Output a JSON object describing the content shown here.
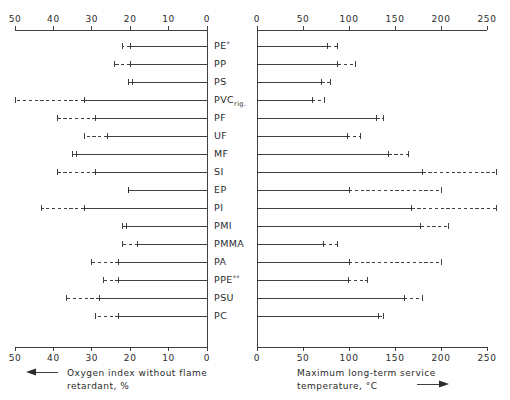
{
  "figure": {
    "background": "#ffffff",
    "ink_color": "#2b2b2b"
  },
  "categories": [
    {
      "label": "PE",
      "sup": "*",
      "sub": ""
    },
    {
      "label": "PP",
      "sup": "",
      "sub": ""
    },
    {
      "label": "PS",
      "sup": "",
      "sub": ""
    },
    {
      "label": "PVC",
      "sup": "",
      "sub": "rig."
    },
    {
      "label": "PF",
      "sup": "",
      "sub": ""
    },
    {
      "label": "UF",
      "sup": "",
      "sub": ""
    },
    {
      "label": "MF",
      "sup": "",
      "sub": ""
    },
    {
      "label": "SI",
      "sup": "",
      "sub": ""
    },
    {
      "label": "EP",
      "sup": "",
      "sub": ""
    },
    {
      "label": "PI",
      "sup": "",
      "sub": ""
    },
    {
      "label": "PMI",
      "sup": "",
      "sub": ""
    },
    {
      "label": "PMMA",
      "sup": "",
      "sub": ""
    },
    {
      "label": "PA",
      "sup": "",
      "sub": ""
    },
    {
      "label": "PPE",
      "sup": "**",
      "sub": ""
    },
    {
      "label": "PSU",
      "sup": "",
      "sub": ""
    },
    {
      "label": "PC",
      "sup": "",
      "sub": ""
    }
  ],
  "chart_data": [
    {
      "type": "bar",
      "orientation": "horizontal-reversed",
      "panel": "left",
      "title": "",
      "xlabel": "Oxygen index without flame retardant, %",
      "ylabel": "",
      "xlim": [
        50,
        0
      ],
      "axis_position": "top-and-bottom",
      "axis_direction": "right-to-left",
      "arrow_direction": "left",
      "grid": false,
      "ticks": [
        50,
        40,
        30,
        20,
        10,
        0
      ],
      "tick_labels": [
        "50",
        "40",
        "30",
        "20",
        "10",
        "0"
      ],
      "categories": [
        "PE",
        "PP",
        "PS",
        "PVC",
        "PF",
        "UF",
        "MF",
        "SI",
        "EP",
        "PI",
        "PMI",
        "PMMA",
        "PA",
        "PPE",
        "PSU",
        "PC"
      ],
      "series": [
        {
          "name": "solid range end",
          "values": [
            20.0,
            20.0,
            19.5,
            32.0,
            29.0,
            26.0,
            34.0,
            29.0,
            20.5,
            32.0,
            21.0,
            18.0,
            23.0,
            23.0,
            28.0,
            23.0
          ]
        },
        {
          "name": "dashed range end",
          "values": [
            22.0,
            24.0,
            20.5,
            50.0,
            39.0,
            32.0,
            35.0,
            39.0,
            20.5,
            43.0,
            22.0,
            22.0,
            30.0,
            27.0,
            36.5,
            29.0
          ]
        }
      ]
    },
    {
      "type": "bar",
      "orientation": "horizontal",
      "panel": "right",
      "title": "",
      "xlabel": "Maximum long-term service temperature, °C",
      "ylabel": "",
      "xlim": [
        0,
        250
      ],
      "axis_position": "top-and-bottom",
      "axis_direction": "left-to-right",
      "arrow_direction": "right",
      "grid": false,
      "ticks": [
        0,
        50,
        100,
        150,
        200,
        250
      ],
      "tick_labels": [
        "0",
        "50",
        "100",
        "150",
        "200",
        "250"
      ],
      "categories": [
        "PE",
        "PP",
        "PS",
        "PVC",
        "PF",
        "UF",
        "MF",
        "SI",
        "EP",
        "PI",
        "PMI",
        "PMMA",
        "PA",
        "PPE",
        "PSU",
        "PC"
      ],
      "series": [
        {
          "name": "solid range end",
          "values": [
            77,
            88,
            70,
            60,
            130,
            98,
            143,
            180,
            100,
            168,
            178,
            72,
            100,
            99,
            160,
            132
          ]
        },
        {
          "name": "dashed range end",
          "values": [
            88,
            107,
            80,
            73,
            137,
            113,
            165,
            260,
            200,
            260,
            208,
            87,
            200,
            120,
            180,
            138
          ]
        }
      ]
    }
  ],
  "axis_titles": {
    "left_line1": "Oxygen index without flame",
    "left_line2": "retardant, %",
    "right_line1": "Maximum long-term service",
    "right_line2": "temperature, °C"
  },
  "tick_labels": {
    "left": [
      "50",
      "40",
      "30",
      "20",
      "10",
      "0"
    ],
    "right": [
      "0",
      "50",
      "100",
      "150",
      "200",
      "250"
    ]
  }
}
